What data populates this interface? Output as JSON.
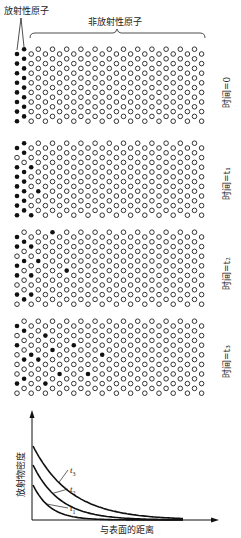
{
  "labels": {
    "radioactive_atoms": "放射性原子",
    "non_radioactive_atoms": "非放射性原子"
  },
  "lattice": {
    "columns": 27,
    "rows": 8,
    "x0": 17,
    "col_spacing": 7.1,
    "row_spacing": 9.6,
    "odd_col_offset": -4.8,
    "atom_radius": 2.3,
    "colors": {
      "radioactive": "#111111",
      "non_radioactive_stroke": "#333333"
    }
  },
  "panels": [
    {
      "time_label": "时间=0",
      "y0": 54,
      "label_y": 108,
      "radioactive": [
        [
          0,
          0
        ],
        [
          0,
          1
        ],
        [
          0,
          2
        ],
        [
          0,
          3
        ],
        [
          0,
          4
        ],
        [
          0,
          5
        ],
        [
          0,
          6
        ],
        [
          0,
          7
        ],
        [
          1,
          0
        ],
        [
          1,
          1
        ],
        [
          1,
          2
        ],
        [
          1,
          3
        ],
        [
          1,
          4
        ],
        [
          1,
          5
        ],
        [
          1,
          6
        ],
        [
          1,
          7
        ]
      ]
    },
    {
      "time_label": "时间=t₁",
      "y0": 148,
      "label_y": 200,
      "radioactive": [
        [
          0,
          0
        ],
        [
          0,
          2
        ],
        [
          0,
          3
        ],
        [
          0,
          4
        ],
        [
          0,
          5
        ],
        [
          0,
          6
        ],
        [
          0,
          7
        ],
        [
          1,
          0
        ],
        [
          1,
          1
        ],
        [
          1,
          3
        ],
        [
          1,
          4
        ],
        [
          1,
          5
        ],
        [
          1,
          6
        ],
        [
          1,
          7
        ],
        [
          2,
          2
        ],
        [
          2,
          7
        ],
        [
          3,
          5
        ]
      ]
    },
    {
      "time_label": "时间=t₂",
      "y0": 237,
      "label_y": 290,
      "radioactive": [
        [
          0,
          0
        ],
        [
          0,
          1
        ],
        [
          0,
          3
        ],
        [
          0,
          4
        ],
        [
          0,
          6
        ],
        [
          1,
          1
        ],
        [
          1,
          3
        ],
        [
          1,
          7
        ],
        [
          2,
          1
        ],
        [
          2,
          4
        ],
        [
          2,
          6
        ],
        [
          3,
          3
        ],
        [
          5,
          0
        ],
        [
          7,
          4
        ]
      ]
    },
    {
      "time_label": "时间=t₃",
      "y0": 326,
      "label_y": 378,
      "radioactive": [
        [
          0,
          0
        ],
        [
          0,
          2
        ],
        [
          0,
          6
        ],
        [
          1,
          1
        ],
        [
          1,
          4
        ],
        [
          1,
          6
        ],
        [
          2,
          3
        ],
        [
          3,
          4
        ],
        [
          4,
          1
        ],
        [
          4,
          6
        ],
        [
          5,
          3
        ],
        [
          6,
          5
        ],
        [
          8,
          2
        ],
        [
          10,
          5
        ],
        [
          12,
          3
        ]
      ]
    }
  ],
  "chart_data": {
    "type": "line",
    "title": "",
    "xlabel": "与表面的距离",
    "ylabel": "放射物密度",
    "series": [
      {
        "name": "t1",
        "label": "t",
        "sub": "1",
        "start_y": 485,
        "decay": 17
      },
      {
        "name": "t2",
        "label": "t",
        "sub": "2",
        "start_y": 465,
        "decay": 27
      },
      {
        "name": "t3",
        "label": "t",
        "sub": "3",
        "start_y": 446,
        "decay": 38
      }
    ],
    "grid": false,
    "legend": "inline leader-line labels"
  }
}
